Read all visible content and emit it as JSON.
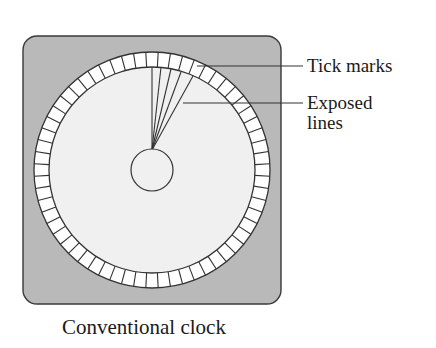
{
  "figure": {
    "caption": "Conventional clock",
    "labels": {
      "tick_marks": "Tick marks",
      "exposed_lines_line1": "Exposed",
      "exposed_lines_line2": "lines"
    }
  },
  "clock": {
    "frame": {
      "x": 23,
      "y": 36,
      "width": 258,
      "height": 268,
      "radius": 14,
      "fill": "#b9b9b9",
      "stroke": "#3a3a3a"
    },
    "center": {
      "x": 152,
      "y": 170
    },
    "outer_ring_radius": 118,
    "inner_ring_radius": 103,
    "ring_fill": "#ffffff",
    "dial_fill": "#f0f0f0",
    "tick_count": 60,
    "hub_radius": 21,
    "exposed_line_ends": [
      {
        "x": 152,
        "y": 67
      },
      {
        "x": 161,
        "y": 67
      },
      {
        "x": 171,
        "y": 69
      },
      {
        "x": 181,
        "y": 72
      },
      {
        "x": 193,
        "y": 76
      }
    ],
    "exposed_line_origin": {
      "x": 152,
      "y": 150
    }
  },
  "leaders": {
    "tick_marks": {
      "x1": 197,
      "y1": 66,
      "x2": 303,
      "y2": 66
    },
    "exposed_lines": {
      "x1": 183,
      "y1": 103,
      "x2": 303,
      "y2": 103
    }
  },
  "colors": {
    "stroke": "#333333",
    "frame_fill": "#b9b9b9",
    "dial_fill": "#f0f0f0",
    "ring_fill": "#ffffff"
  }
}
